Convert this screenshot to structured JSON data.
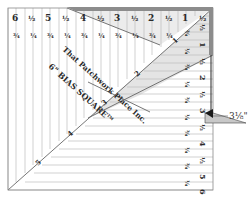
{
  "ruler": {
    "name": "6\" BIAS SQUARE",
    "trademark": "TM",
    "maker": "That Patchwork Place Inc.",
    "top_major_labels": [
      "6",
      "½",
      "5",
      "½",
      "4",
      "½",
      "3",
      "½",
      "2",
      "½",
      "1",
      "½"
    ],
    "top_minor_labels": [
      "¾",
      "¼",
      "¾",
      "¼",
      "¾",
      "¼",
      "¾",
      "¼",
      "¾",
      "¼"
    ],
    "right_major_labels": [
      "½",
      "1",
      "½",
      "2",
      "½",
      "3",
      "½",
      "4",
      "½",
      "5",
      "½",
      "6"
    ],
    "right_minor_labels": [
      "¾",
      "¼",
      "¾",
      "¼",
      "¾",
      "¼",
      "¾",
      "¼",
      "¾",
      "¼",
      "¾"
    ],
    "diagonal_labels": [
      "1",
      "2",
      "3",
      "4",
      "5"
    ],
    "measurement_callout": "3⅛\"",
    "colors": {
      "edge_band": "#8c8c8c",
      "shaded_triangle": "#e6e6e6",
      "grid_line": "#b5b5b5",
      "outline": "#555555",
      "pointer": "#1a1a1a"
    }
  }
}
